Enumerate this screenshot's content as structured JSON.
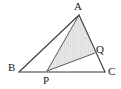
{
  "figure": {
    "type": "geometry-diagram",
    "background_color": "#ffffff",
    "stroke_color": "#3a3a3a",
    "shaded_fill_color": "#e5e5e5",
    "hatch_color": "#cfcfcf",
    "label_color": "#1a1a1a",
    "points": {
      "A": {
        "label": "A",
        "x": 79,
        "y": 15,
        "label_x": 74,
        "label_y": 1
      },
      "B": {
        "label": "B",
        "x": 19,
        "y": 72,
        "label_x": 8,
        "label_y": 62
      },
      "C": {
        "label": "C",
        "x": 105,
        "y": 72,
        "label_x": 108,
        "label_y": 66
      },
      "P": {
        "label": "P",
        "x": 47,
        "y": 71,
        "label_x": 43,
        "label_y": 75
      },
      "Q": {
        "label": "Q",
        "x": 95,
        "y": 53,
        "label_x": 96,
        "label_y": 44
      }
    },
    "segments": [
      {
        "name": "side-AB",
        "from": "A",
        "to": "B"
      },
      {
        "name": "side-BC",
        "from": "B",
        "to": "C"
      },
      {
        "name": "side-AC",
        "from": "A",
        "to": "C"
      },
      {
        "name": "cevian-AP",
        "from": "A",
        "to": "P"
      },
      {
        "name": "segment-PQ",
        "from": "P",
        "to": "Q"
      }
    ],
    "shaded_regions": [
      {
        "name": "triangle-APQ",
        "vertices": [
          "A",
          "P",
          "Q"
        ]
      }
    ]
  }
}
